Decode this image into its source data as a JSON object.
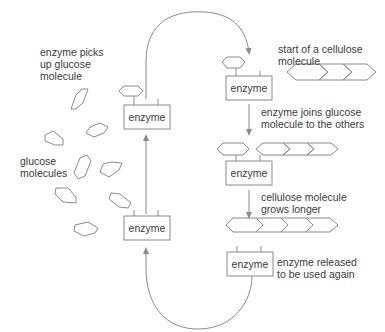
{
  "diagram": {
    "type": "process-cycle",
    "labels": {
      "picks_up": "enzyme picks\nup glucose\nmolecule",
      "glucose": "glucose\nmolecules",
      "start": "start of a cellulose\nmolecule",
      "joins": "enzyme joins glucose\nmolecule to the others",
      "grows": "cellulose molecule\ngrows longer",
      "released": "enzyme released\nto be used again"
    },
    "enzyme_label": "enzyme",
    "colors": {
      "stroke": "#8a8a8a",
      "text": "#3a3a3a",
      "box_fill": "#ffffff"
    },
    "steps": [
      {
        "id": 1,
        "text": "enzyme picks up glucose molecule"
      },
      {
        "id": 2,
        "text": "start of a cellulose molecule"
      },
      {
        "id": 3,
        "text": "enzyme joins glucose molecule to the others"
      },
      {
        "id": 4,
        "text": "cellulose molecule grows longer"
      },
      {
        "id": 5,
        "text": "enzyme released to be used again"
      }
    ]
  }
}
